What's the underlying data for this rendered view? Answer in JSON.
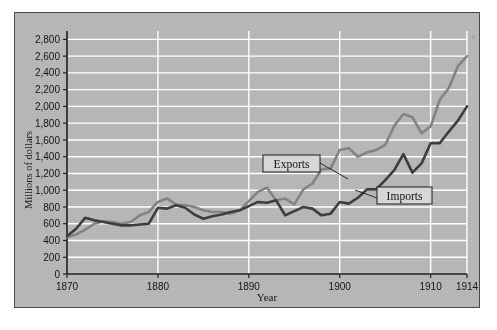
{
  "chart_data": {
    "type": "line",
    "title": "",
    "xlabel": "Year",
    "ylabel": "Millions of dollars",
    "xlim": [
      1870,
      1914
    ],
    "ylim": [
      0,
      2900
    ],
    "ytick_labels": [
      "0",
      "200",
      "400",
      "600",
      "800",
      "1,000",
      "1,200",
      "1,400",
      "1,600",
      "1,800",
      "2,000",
      "2,200",
      "2,400",
      "2,600",
      "2,800"
    ],
    "ytick_values": [
      0,
      200,
      400,
      600,
      800,
      1000,
      1200,
      1400,
      1600,
      1800,
      2000,
      2200,
      2400,
      2600,
      2800
    ],
    "xtick_labels": [
      "1870",
      "1880",
      "1890",
      "1900",
      "1910",
      "1914"
    ],
    "xtick_values": [
      1870,
      1880,
      1890,
      1900,
      1910,
      1914
    ],
    "grid": true,
    "grid_color": "#ffffff",
    "plot_background": "#b6b6b6",
    "legend_position": "inline-callouts",
    "series": [
      {
        "name": "Exports",
        "color": "#838383",
        "x": [
          1870,
          1871,
          1872,
          1873,
          1874,
          1875,
          1876,
          1877,
          1878,
          1879,
          1880,
          1881,
          1882,
          1883,
          1884,
          1885,
          1886,
          1887,
          1888,
          1889,
          1890,
          1891,
          1892,
          1893,
          1894,
          1895,
          1896,
          1897,
          1898,
          1899,
          1900,
          1901,
          1902,
          1903,
          1904,
          1905,
          1906,
          1907,
          1908,
          1909,
          1910,
          1911,
          1912,
          1913,
          1914
        ],
        "values": [
          440,
          470,
          530,
          600,
          630,
          620,
          600,
          620,
          700,
          740,
          860,
          900,
          830,
          820,
          800,
          760,
          740,
          740,
          720,
          760,
          870,
          980,
          1030,
          880,
          900,
          830,
          1010,
          1080,
          1250,
          1260,
          1480,
          1500,
          1400,
          1450,
          1480,
          1540,
          1770,
          1910,
          1870,
          1680,
          1760,
          2080,
          2220,
          2480,
          2600
        ]
      },
      {
        "name": "Imports",
        "color": "#3d3d3d",
        "x": [
          1870,
          1871,
          1872,
          1873,
          1874,
          1875,
          1876,
          1877,
          1878,
          1879,
          1880,
          1881,
          1882,
          1883,
          1884,
          1885,
          1886,
          1887,
          1888,
          1889,
          1890,
          1891,
          1892,
          1893,
          1894,
          1895,
          1896,
          1897,
          1898,
          1899,
          1900,
          1901,
          1902,
          1903,
          1904,
          1905,
          1906,
          1907,
          1908,
          1909,
          1910,
          1911,
          1912,
          1913,
          1914
        ],
        "values": [
          450,
          540,
          670,
          640,
          620,
          600,
          580,
          580,
          590,
          600,
          790,
          780,
          820,
          790,
          710,
          660,
          690,
          710,
          740,
          760,
          810,
          860,
          850,
          880,
          700,
          750,
          800,
          780,
          700,
          720,
          860,
          840,
          910,
          1010,
          1010,
          1120,
          1240,
          1430,
          1210,
          1320,
          1560,
          1560,
          1700,
          1830,
          2000
        ]
      }
    ],
    "annotations": [
      {
        "label": "Exports",
        "x": 1890,
        "y": 1400
      },
      {
        "label": "Imports",
        "x": 1902,
        "y": 1010
      }
    ]
  },
  "figure": {
    "corner_mark": "4"
  }
}
